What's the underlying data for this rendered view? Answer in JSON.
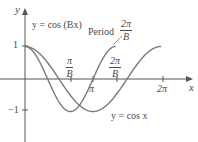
{
  "diagram": {
    "axes": {
      "x_label": "x",
      "y_label": "y",
      "y_ticks": [
        "1",
        "−1"
      ],
      "x_ticks": [
        "π",
        "2π"
      ]
    },
    "fraction_ticks": [
      {
        "num": "π",
        "den": "B"
      },
      {
        "num": "2π",
        "den": "B"
      }
    ],
    "curves": [
      {
        "name": "cos-bx",
        "label": "y = cos (Bx)",
        "B": 1.5,
        "color": "#7a7a7a"
      },
      {
        "name": "cos-x",
        "label": "y = cos x",
        "B": 1,
        "color": "#7a7a7a"
      }
    ],
    "period_annotation": {
      "text": "Period",
      "num": "2π",
      "den": "B"
    },
    "colors": {
      "axis": "#555555",
      "curve": "#7a7a7a",
      "text": "#4a4a4a"
    }
  }
}
